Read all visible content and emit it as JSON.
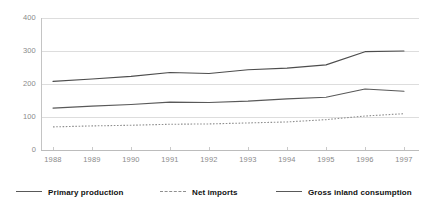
{
  "chart_data": {
    "type": "line",
    "title": "",
    "subtitle": "",
    "xlabel": "",
    "ylabel": "",
    "x": [
      1988,
      1989,
      1990,
      1991,
      1992,
      1993,
      1994,
      1995,
      1996,
      1997
    ],
    "categories": [
      "1988",
      "1989",
      "1990",
      "1991",
      "1992",
      "1993",
      "1994",
      "1995",
      "1996",
      "1997"
    ],
    "xlim": [
      1988,
      1997
    ],
    "ylim": [
      0,
      400
    ],
    "yticks": [
      0,
      100,
      200,
      300,
      400
    ],
    "ytick_labels": [
      "0",
      "100",
      "200",
      "300",
      "400"
    ],
    "grid": true,
    "grid_axis": "y",
    "legend_position": "bottom",
    "series": [
      {
        "name": "Primary production",
        "style": "solid",
        "color": "#595959",
        "values": [
          127,
          133,
          138,
          145,
          144,
          148,
          155,
          160,
          185,
          178
        ]
      },
      {
        "name": "Net imports",
        "style": "dashed",
        "color": "#8f8f8f",
        "values": [
          70,
          73,
          75,
          78,
          79,
          82,
          85,
          92,
          103,
          110
        ]
      },
      {
        "name": "Gross inland consumption",
        "style": "solid",
        "color": "#4d4d4d",
        "values": [
          208,
          215,
          223,
          235,
          232,
          243,
          248,
          258,
          298,
          300
        ]
      }
    ]
  },
  "axes": {
    "y_labels": [
      "400",
      "300",
      "200",
      "100",
      "0"
    ],
    "x_labels": [
      "1988",
      "1989",
      "1990",
      "1991",
      "1992",
      "1993",
      "1994",
      "1995",
      "1996",
      "1997"
    ]
  },
  "legend": {
    "items": [
      {
        "label": "Primary production",
        "style": "solid"
      },
      {
        "label": "Net imports",
        "style": "dashed"
      },
      {
        "label": "Gross inland consumption",
        "style": "solid"
      }
    ]
  },
  "colors": {
    "grid": "#dddddd",
    "axis": "#bcbcbc",
    "tick_text": "#8a8a8a",
    "legend_text": "#111111",
    "background": "#ffffff"
  }
}
